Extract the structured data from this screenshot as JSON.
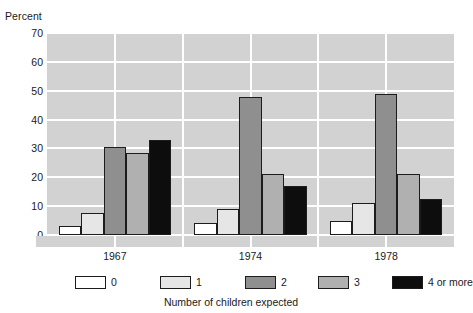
{
  "chart_data": {
    "type": "bar",
    "title": "",
    "ylabel": "Percent",
    "xlabel": "Number of children expected",
    "categories": [
      "1967",
      "1974",
      "1978"
    ],
    "series": [
      {
        "name": "0",
        "color": "#ffffff",
        "values": [
          3,
          4,
          5
        ]
      },
      {
        "name": "1",
        "color": "#e6e6e6",
        "values": [
          7.5,
          9,
          11
        ]
      },
      {
        "name": "2",
        "color": "#8f8f8f",
        "values": [
          30.5,
          48,
          49
        ]
      },
      {
        "name": "3",
        "color": "#b0b0b0",
        "values": [
          28.5,
          21,
          21
        ]
      },
      {
        "name": "4 or more",
        "color": "#0d0d0d",
        "values": [
          33,
          17,
          12.5
        ]
      }
    ],
    "ylim": [
      0,
      70
    ],
    "yticks": [
      0,
      10,
      20,
      30,
      40,
      50,
      60,
      70
    ],
    "ytick_labels": [
      "0",
      "10",
      "20",
      "30",
      "40",
      "50",
      "60",
      "70"
    ],
    "grid": true,
    "grid_color": "#ffffff",
    "plot_background": "#d2d2d2",
    "bar_edge_color": "#1c1c1c",
    "legend_position": "bottom"
  },
  "legend": {
    "items": [
      {
        "label": "0"
      },
      {
        "label": "1"
      },
      {
        "label": "2"
      },
      {
        "label": "3"
      },
      {
        "label": "4 or more"
      }
    ]
  }
}
